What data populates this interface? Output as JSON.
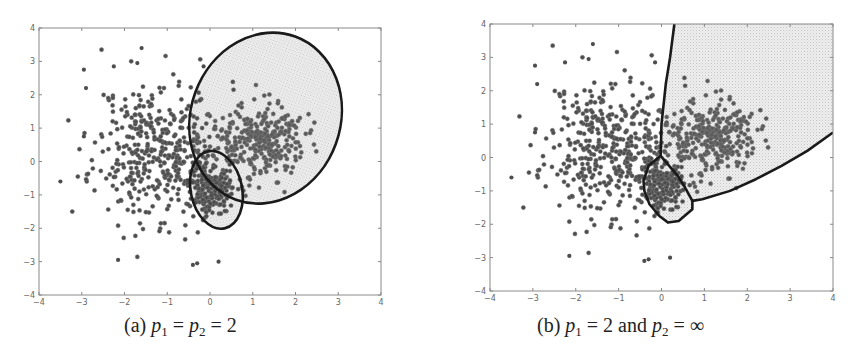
{
  "chart_data": [
    {
      "type": "scatter",
      "title": "",
      "caption": {
        "label": "(a)",
        "text": "p1 = p2 = 2",
        "parts": [
          "(a) ",
          "p",
          "1",
          " = ",
          "p",
          "2",
          " = 2"
        ]
      },
      "xlabel": "",
      "ylabel": "",
      "xlim": [
        -4,
        4
      ],
      "ylim": [
        -4,
        4
      ],
      "xticks": [
        -4,
        -3,
        -2,
        -1,
        0,
        1,
        2,
        3,
        4
      ],
      "yticks": [
        -4,
        -3,
        -2,
        -1,
        0,
        1,
        2,
        3,
        4
      ],
      "grid": false,
      "legend": null,
      "series": [
        {
          "name": "cluster-left",
          "center": [
            -1.2,
            0.3
          ],
          "spread": [
            0.75,
            1.05
          ],
          "count": 420,
          "seed": 11,
          "color": "#4d4d4d"
        },
        {
          "name": "cluster-right",
          "center": [
            1.1,
            0.6
          ],
          "spread": [
            0.55,
            0.55
          ],
          "count": 320,
          "seed": 23,
          "color": "#5a5a5a"
        },
        {
          "name": "cluster-small",
          "center": [
            0.0,
            -0.8
          ],
          "spread": [
            0.22,
            0.4
          ],
          "count": 180,
          "seed": 37,
          "color": "#4a4a4a"
        }
      ],
      "outliers": [
        [
          -3.5,
          -0.6
        ],
        [
          -2.95,
          2.75
        ],
        [
          -2.9,
          2.2
        ],
        [
          -2.95,
          0.75
        ],
        [
          -2.15,
          -2.95
        ],
        [
          -1.6,
          3.4
        ],
        [
          -0.4,
          -3.1
        ],
        [
          -0.3,
          -3.05
        ],
        [
          0.2,
          -3.0
        ],
        [
          -0.15,
          2.85
        ],
        [
          -1.7,
          2.95
        ],
        [
          -2.25,
          2.85
        ]
      ],
      "regions": [
        {
          "name": "large-ellipse",
          "shape": "ellipse",
          "center": [
            1.3,
            1.3
          ],
          "rx": 1.75,
          "ry": 2.6,
          "rotation_deg": 20,
          "fill": "#e6e6e6"
        },
        {
          "name": "small-ellipse",
          "shape": "ellipse",
          "center": [
            0.15,
            -0.85
          ],
          "rx": 0.6,
          "ry": 1.18,
          "rotation_deg": -12,
          "fill": "#e6e6e6"
        }
      ]
    },
    {
      "type": "scatter",
      "title": "",
      "caption": {
        "label": "(b)",
        "text": "p1 = 2 and p2 = ∞",
        "parts": [
          "(b) ",
          "p",
          "1",
          " = 2 and ",
          "p",
          "2",
          " = ∞"
        ]
      },
      "xlabel": "",
      "ylabel": "",
      "xlim": [
        -4,
        4
      ],
      "ylim": [
        -4,
        4
      ],
      "xticks": [
        -4,
        -3,
        -2,
        -1,
        0,
        1,
        2,
        3,
        4
      ],
      "yticks": [
        -4,
        -3,
        -2,
        -1,
        0,
        1,
        2,
        3,
        4
      ],
      "grid": false,
      "legend": null,
      "series": [
        {
          "name": "cluster-left",
          "center": [
            -1.2,
            0.3
          ],
          "spread": [
            0.75,
            1.05
          ],
          "count": 420,
          "seed": 11,
          "color": "#4d4d4d"
        },
        {
          "name": "cluster-right",
          "center": [
            1.1,
            0.6
          ],
          "spread": [
            0.55,
            0.55
          ],
          "count": 320,
          "seed": 23,
          "color": "#5a5a5a"
        },
        {
          "name": "cluster-small",
          "center": [
            0.0,
            -0.8
          ],
          "spread": [
            0.22,
            0.4
          ],
          "count": 180,
          "seed": 37,
          "color": "#4a4a4a"
        }
      ],
      "outliers": [
        [
          -3.5,
          -0.6
        ],
        [
          -2.95,
          2.75
        ],
        [
          -2.9,
          2.2
        ],
        [
          -2.95,
          0.75
        ],
        [
          -2.15,
          -2.95
        ],
        [
          -1.6,
          3.4
        ],
        [
          -0.4,
          -3.1
        ],
        [
          -0.3,
          -3.05
        ],
        [
          0.2,
          -3.0
        ],
        [
          -0.15,
          2.85
        ],
        [
          -1.7,
          2.95
        ],
        [
          -2.25,
          2.85
        ]
      ],
      "regions": [
        {
          "name": "right-wedge",
          "shape": "polygon",
          "fill": "#e6e6e6",
          "points": [
            [
              0.3,
              4.0
            ],
            [
              0.15,
              2.5
            ],
            [
              0.0,
              1.0
            ],
            [
              -0.02,
              0.05
            ],
            [
              0.38,
              -0.55
            ],
            [
              0.72,
              -1.3
            ],
            [
              0.95,
              -1.25
            ],
            [
              1.6,
              -1.0
            ],
            [
              2.2,
              -0.65
            ],
            [
              2.8,
              -0.25
            ],
            [
              3.4,
              0.2
            ],
            [
              4.0,
              0.75
            ],
            [
              4.0,
              4.0
            ]
          ]
        },
        {
          "name": "small-polygon",
          "shape": "polygon",
          "fill": "#e6e6e6",
          "points": [
            [
              -0.02,
              0.05
            ],
            [
              -0.3,
              -0.25
            ],
            [
              -0.42,
              -0.7
            ],
            [
              -0.4,
              -1.0
            ],
            [
              -0.28,
              -1.4
            ],
            [
              -0.05,
              -1.75
            ],
            [
              0.15,
              -1.95
            ],
            [
              0.4,
              -1.9
            ],
            [
              0.72,
              -1.55
            ],
            [
              0.72,
              -1.3
            ],
            [
              0.55,
              -0.9
            ],
            [
              0.38,
              -0.55
            ]
          ]
        }
      ],
      "boundary_lines": [
        {
          "name": "vertical-boundary",
          "points": [
            [
              0.3,
              4.0
            ],
            [
              0.2,
              3.0
            ],
            [
              0.1,
              2.2
            ],
            [
              0.0,
              1.0
            ],
            [
              -0.02,
              0.05
            ]
          ]
        },
        {
          "name": "lower-boundary",
          "points": [
            [
              0.72,
              -1.3
            ],
            [
              0.95,
              -1.25
            ],
            [
              1.6,
              -1.0
            ],
            [
              2.2,
              -0.65
            ],
            [
              2.8,
              -0.25
            ],
            [
              3.4,
              0.2
            ],
            [
              4.0,
              0.75
            ]
          ]
        }
      ]
    }
  ],
  "panels": [
    {
      "frame": {
        "left": 39,
        "top": 28,
        "right": 381,
        "bottom": 295
      },
      "caption_pos": {
        "left": 124,
        "top": 314
      }
    },
    {
      "frame": {
        "left": 490,
        "top": 24,
        "right": 833,
        "bottom": 291
      },
      "caption_pos": {
        "left": 537,
        "top": 314
      }
    }
  ]
}
